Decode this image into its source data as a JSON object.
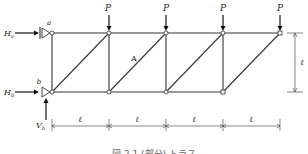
{
  "diagram": {
    "type": "truss",
    "panels": 4,
    "nodes_top_x": [
      52,
      109,
      166,
      223,
      280
    ],
    "nodes_bottom_x": [
      52,
      109,
      166,
      223
    ],
    "top_y": 33,
    "bottom_y": 92,
    "support_labels": {
      "top": "a",
      "bottom": "b"
    },
    "reaction_labels": {
      "ha": "H",
      "ha_sub": "a",
      "hb": "H",
      "hb_sub": "b",
      "vb": "V",
      "vb_sub": "b"
    },
    "load_label": "P",
    "loads_count": 4,
    "member_label": "A",
    "span_label": "ℓ",
    "height_label": "ℓ",
    "caption": "図 2.1 (部分) トラス"
  }
}
